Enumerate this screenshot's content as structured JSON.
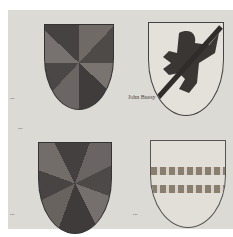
{
  "image": {
    "description": "Manuscript page with four heraldic shields and handwritten annotations",
    "shields": [
      {
        "position": "top-left",
        "description": "gyronny shield, dark grey segments"
      },
      {
        "position": "top-right",
        "description": "griffin segreant with a bend"
      },
      {
        "position": "bottom-left",
        "description": "gyronny shield, dark grey segments"
      },
      {
        "position": "bottom-right",
        "description": "two bars dancetty / fusilly"
      }
    ],
    "notes": {
      "n1": "...",
      "n2": "John Bussy",
      "n3": "...",
      "n4": "...",
      "n5": "..."
    }
  }
}
